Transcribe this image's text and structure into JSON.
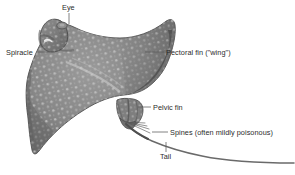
{
  "figure": {
    "background_color": "#ffffff",
    "leader_line_color": "#555555",
    "label_text_color": "#2b2b2b",
    "body_color": "#8a8a8a",
    "body_shadow_color": "#5e5e5e",
    "spot_color": "#c2c2c2",
    "outline_color": "#4a4a4a",
    "tail_color": "#6d6d6d"
  },
  "labels": {
    "eye": "Eye",
    "spiracle": "Spiracle",
    "pectoral_fin": "Pectoral fin (\"wing\")",
    "pelvic_fin": "Pelvic fin",
    "spines": "Spines (often mildly poisonous)",
    "tail": "Tail"
  }
}
